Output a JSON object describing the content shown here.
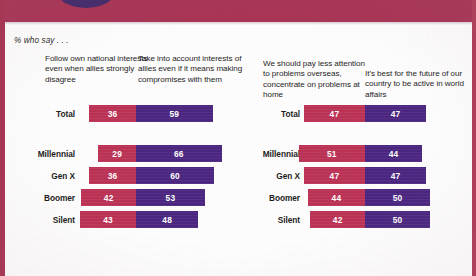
{
  "note": "% who say . . .",
  "colors": {
    "red": "#bb3154",
    "purple": "#4a2580",
    "frame": "#a83352",
    "band": "#a93455",
    "band_circle": "#3b2a6e"
  },
  "headers": [
    "Follow own national interests even when allies strongly disagree",
    "Take into account interests of allies even if it means making compromises with them",
    "We should pay less attention to problems overseas, concentrate on problems at home",
    "It's best for the future of our country to be active in world affairs"
  ],
  "row_labels": [
    "Total",
    "Millennial",
    "Gen X",
    "Boomer",
    "Silent"
  ],
  "chart_data": [
    {
      "type": "bar",
      "title": "Follow own national interests vs. take into account interests of allies",
      "subtitle": "% who say . . .",
      "orientation": "horizontal",
      "stacked": true,
      "diverging": true,
      "xlabel": "",
      "ylabel": "",
      "categories": [
        "Total",
        "Millennial",
        "Gen X",
        "Boomer",
        "Silent"
      ],
      "series": [
        {
          "name": "Follow own national interests even when allies strongly disagree",
          "color": "#bb3154",
          "values": [
            36,
            29,
            36,
            42,
            43
          ]
        },
        {
          "name": "Take into account interests of allies even if it means making compromises with them",
          "color": "#4a2580",
          "values": [
            59,
            66,
            60,
            53,
            48
          ]
        }
      ],
      "legend_position": "top",
      "grid": false
    },
    {
      "type": "bar",
      "title": "Pay less attention to problems overseas vs. be active in world affairs",
      "subtitle": "% who say . . .",
      "orientation": "horizontal",
      "stacked": true,
      "diverging": true,
      "xlabel": "",
      "ylabel": "",
      "categories": [
        "Total",
        "Millennial",
        "Gen X",
        "Boomer",
        "Silent"
      ],
      "series": [
        {
          "name": "We should pay less attention to problems overseas, concentrate on problems at home",
          "color": "#bb3154",
          "values": [
            47,
            51,
            47,
            44,
            42
          ]
        },
        {
          "name": "It's best for the future of our country to be active in world affairs",
          "color": "#4a2580",
          "values": [
            47,
            44,
            47,
            50,
            50
          ]
        }
      ],
      "legend_position": "top",
      "grid": false
    }
  ]
}
